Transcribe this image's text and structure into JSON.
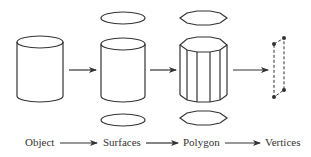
{
  "stages": [
    {
      "id": "object",
      "label": "Object"
    },
    {
      "id": "surfaces",
      "label": "Surfaces"
    },
    {
      "id": "polygon",
      "label": "Polygon"
    },
    {
      "id": "vertices",
      "label": "Vertices"
    }
  ],
  "colors": {
    "stroke": "#333333",
    "background": "#ffffff"
  }
}
